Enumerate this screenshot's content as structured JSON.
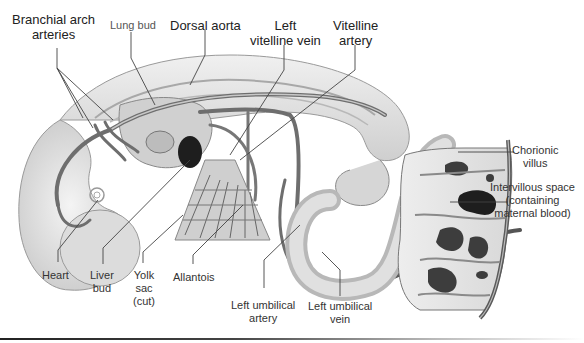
{
  "figure": {
    "labels": [
      {
        "id": "branchial-arch-arteries",
        "text": "Branchial arch\narteries",
        "line1": "Branchial arch",
        "line2": "arteries"
      },
      {
        "id": "lung-bud",
        "text": "Lung bud"
      },
      {
        "id": "dorsal-aorta",
        "text": "Dorsal aorta"
      },
      {
        "id": "left-vitelline-vein",
        "line1": "Left",
        "line2": "vitelline vein"
      },
      {
        "id": "vitelline-artery",
        "line1": "Vitelline",
        "line2": "artery"
      },
      {
        "id": "chorionic-villus",
        "line1": "Chorionic",
        "line2": "villus"
      },
      {
        "id": "intervillous-space",
        "line1": "Intervillous space",
        "line2": "(containing",
        "line3": "maternal blood)"
      },
      {
        "id": "heart",
        "text": "Heart"
      },
      {
        "id": "liver-bud",
        "line1": "Liver",
        "line2": "bud"
      },
      {
        "id": "yolk-sac",
        "line1": "Yolk",
        "line2": "sac",
        "line3": "(cut)"
      },
      {
        "id": "allantois",
        "text": "Allantois"
      },
      {
        "id": "left-umbilical-artery",
        "line1": "Left umbilical",
        "line2": "artery"
      },
      {
        "id": "left-umbilical-vein",
        "line1": "Left umbilical",
        "line2": "vein"
      }
    ]
  },
  "colors": {
    "background": "#ffffff",
    "tissue_light": "#e4e4e4",
    "tissue_mid": "#bdbdbd",
    "vessel": "#7a7a7a",
    "vessel_dark": "#3a3a3a",
    "leader_line": "#444444",
    "label_text": "#333333"
  }
}
